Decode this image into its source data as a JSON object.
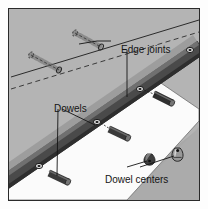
{
  "figure": {
    "name": "dowel-joint-assembly-diagram",
    "kind": "technical-illustration",
    "width": 208,
    "height": 209,
    "outer_background": "#fdfdfd",
    "plate_background": "#b4b4b4",
    "plate_border": "#2a2a2a"
  },
  "labels": {
    "edge_joints": "Edge joints",
    "dowels": "Dowels",
    "dowel_centers": "Dowel centers"
  },
  "colors": {
    "board_dark_edge": "#4a4a4a",
    "board_edge_highlight": "#6e6e6e",
    "board_white_face": "#fbfbfb",
    "board_gray_face": "#a8a8a8",
    "dowel_peg": "#3a3a3a",
    "dowel_peg_end": "#6a6a6a",
    "leader_line": "#1c1c1c",
    "ghost_line": "#555555",
    "hole_mark": "#111111",
    "label_text": "#141414"
  },
  "parts": {
    "edge_joint_holes": [
      {
        "name": "edge-joint-hole-1",
        "cx": 189,
        "cy": 49
      },
      {
        "name": "edge-joint-hole-2",
        "cx": 139,
        "cy": 88
      },
      {
        "name": "edge-joint-hole-3",
        "cx": 96,
        "cy": 121
      },
      {
        "name": "edge-joint-hole-4",
        "cx": 38,
        "cy": 165
      }
    ],
    "dowel_pegs": [
      {
        "name": "dowel-peg-1",
        "x1": 155,
        "y1": 94,
        "x2": 170,
        "y2": 100
      },
      {
        "name": "dowel-peg-2",
        "x1": 110,
        "y1": 129,
        "x2": 126,
        "y2": 136
      },
      {
        "name": "dowel-peg-3",
        "x1": 50,
        "y1": 173,
        "x2": 66,
        "y2": 181
      }
    ],
    "dowel_center_markers": [
      {
        "name": "dowel-center-marker-filled",
        "cx": 146,
        "cy": 155,
        "style": "filled"
      },
      {
        "name": "dowel-center-marker-outline",
        "cx": 175,
        "cy": 151,
        "style": "outline"
      }
    ],
    "ghost_dowels": [
      {
        "name": "ghost-dowel-upper",
        "cx": 96,
        "cy": 40
      },
      {
        "name": "ghost-dowel-lower",
        "cx": 44,
        "cy": 60
      }
    ],
    "construction_lines": [
      {
        "name": "joint-line-solid",
        "style": "solid",
        "x1": 10,
        "y1": 75,
        "x2": 200,
        "y2": 18
      },
      {
        "name": "joint-line-dashed",
        "style": "dashed",
        "x1": 10,
        "y1": 88,
        "x2": 200,
        "y2": 31
      }
    ],
    "leader_lines": [
      {
        "name": "leader-edge-joints-to-band",
        "x1": 126,
        "y1": 47,
        "x2": 131,
        "y2": 94
      },
      {
        "name": "leader-edge-joints-to-ghost",
        "x1": 110,
        "y1": 40,
        "x2": 76,
        "y2": 42
      },
      {
        "name": "leader-dowels-to-peg",
        "x1": 58,
        "y1": 107,
        "x2": 56,
        "y2": 175
      },
      {
        "name": "leader-dowels-to-hole",
        "x1": 62,
        "y1": 107,
        "x2": 98,
        "y2": 125
      },
      {
        "name": "leader-centers-to-marker-1",
        "x1": 126,
        "y1": 163,
        "x2": 144,
        "y2": 159
      },
      {
        "name": "leader-centers-to-marker-2",
        "x1": 140,
        "y1": 164,
        "x2": 172,
        "y2": 154
      }
    ]
  }
}
